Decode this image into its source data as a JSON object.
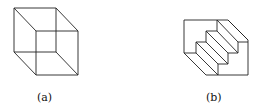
{
  "figures": [
    {
      "id": "a",
      "label": "(a)",
      "description": "Necker cube wireframe"
    },
    {
      "id": "b",
      "label": "(b)",
      "description": "Schroeder staircase reversible figure"
    }
  ],
  "colors": {
    "stroke": "#222222",
    "background": "#ffffff"
  }
}
